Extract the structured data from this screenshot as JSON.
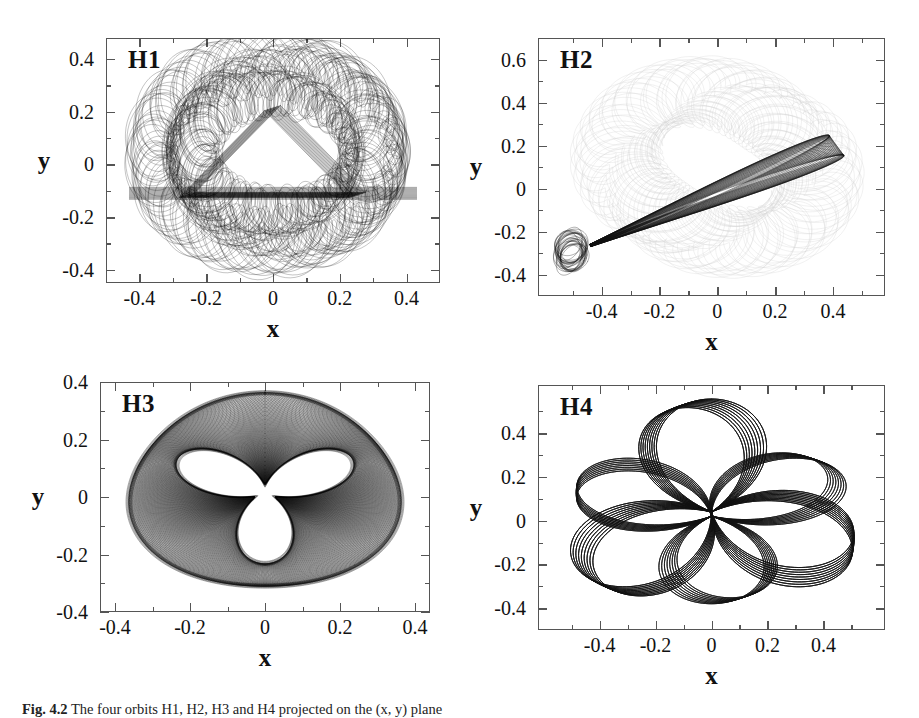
{
  "figure": {
    "caption_label": "Fig. 4.2",
    "caption_text": "The four orbits H1, H2, H3 and H4 projected on the (x, y) plane"
  },
  "panels": [
    {
      "id": "H1",
      "label": "H1",
      "xlabel": "x",
      "ylabel": "y",
      "xticks": [
        "-0.4",
        "-0.2",
        "0",
        "0.2",
        "0.4"
      ],
      "xtick_values": [
        -0.4,
        -0.2,
        0,
        0.2,
        0.4
      ],
      "yticks": [
        "0.4",
        "0.2",
        "0",
        "-0.2",
        "-0.4"
      ],
      "ytick_values": [
        0.4,
        0.2,
        0,
        -0.2,
        -0.4
      ],
      "xlim": [
        -0.5,
        0.5
      ],
      "ylim": [
        -0.45,
        0.48
      ]
    },
    {
      "id": "H2",
      "label": "H2",
      "xlabel": "x",
      "ylabel": "y",
      "xticks": [
        "-0.4",
        "-0.2",
        "0",
        "0.2",
        "0.4"
      ],
      "xtick_values": [
        -0.4,
        -0.2,
        0,
        0.2,
        0.4
      ],
      "yticks": [
        "0.6",
        "0.4",
        "0.2",
        "0",
        "-0.2",
        "-0.4"
      ],
      "ytick_values": [
        0.6,
        0.4,
        0.2,
        0,
        -0.2,
        -0.4
      ],
      "xlim": [
        -0.62,
        0.58
      ],
      "ylim": [
        -0.5,
        0.7
      ]
    },
    {
      "id": "H3",
      "label": "H3",
      "xlabel": "x",
      "ylabel": "y",
      "xticks": [
        "-0.4",
        "-0.2",
        "0",
        "0.2",
        "0.4"
      ],
      "xtick_values": [
        -0.4,
        -0.2,
        0,
        0.2,
        0.4
      ],
      "yticks": [
        "0.4",
        "0.2",
        "0",
        "-0.2",
        "-0.4"
      ],
      "ytick_values": [
        0.4,
        0.2,
        0,
        -0.2,
        -0.4
      ],
      "xlim": [
        -0.44,
        0.44
      ],
      "ylim": [
        -0.4,
        0.4
      ]
    },
    {
      "id": "H4",
      "label": "H4",
      "xlabel": "x",
      "ylabel": "y",
      "xticks": [
        "-0.4",
        "-0.2",
        "0",
        "0.2",
        "0.4"
      ],
      "xtick_values": [
        -0.4,
        -0.2,
        0,
        0.2,
        0.4
      ],
      "yticks": [
        "0.4",
        "0.2",
        "0",
        "-0.2",
        "-0.4"
      ],
      "ytick_values": [
        0.4,
        0.2,
        0,
        -0.2,
        -0.4
      ],
      "xlim": [
        -0.62,
        0.62
      ],
      "ylim": [
        -0.5,
        0.62
      ]
    }
  ],
  "chart_data": {
    "type": "line",
    "title": "",
    "subplots": [
      {
        "name": "H1",
        "xlabel": "x",
        "ylabel": "y",
        "xlim": [
          -0.5,
          0.5
        ],
        "ylim": [
          -0.45,
          0.48
        ],
        "xticks": [
          -0.4,
          -0.2,
          0,
          0.2,
          0.4
        ],
        "yticks": [
          -0.4,
          -0.2,
          0,
          0.2,
          0.4
        ],
        "grid": false,
        "legend": "none",
        "annotation": "H1",
        "orbit_kind": "boxlet-triangular-envelope",
        "envelope_extent": {
          "x_min": -0.44,
          "x_max": 0.44,
          "y_min": -0.35,
          "y_max": 0.47
        },
        "dark_caustic_triangle_vertices": [
          [
            0.0,
            0.21
          ],
          [
            -0.25,
            -0.12
          ],
          [
            0.25,
            -0.12
          ]
        ]
      },
      {
        "name": "H2",
        "xlabel": "x",
        "ylabel": "y",
        "xlim": [
          -0.62,
          0.58
        ],
        "ylim": [
          -0.5,
          0.7
        ],
        "xticks": [
          -0.4,
          -0.2,
          0,
          0.2,
          0.4
        ],
        "yticks": [
          -0.4,
          -0.2,
          0,
          0.2,
          0.4,
          0.6
        ],
        "grid": false,
        "legend": "none",
        "annotation": "H2",
        "orbit_kind": "elongated-banana-band-with-faint-background",
        "band_from": [
          -0.55,
          -0.27
        ],
        "band_to": [
          0.45,
          0.28
        ],
        "faint_background_gray": "#dedede"
      },
      {
        "name": "H3",
        "xlabel": "x",
        "ylabel": "y",
        "xlim": [
          -0.44,
          0.44
        ],
        "ylim": [
          -0.4,
          0.4
        ],
        "xticks": [
          -0.4,
          -0.2,
          0,
          0.2,
          0.4
        ],
        "yticks": [
          -0.4,
          -0.2,
          0,
          0.2,
          0.4
        ],
        "grid": false,
        "legend": "none",
        "annotation": "H3",
        "orbit_kind": "annular-tube-three-fold",
        "outer_radius_x": 0.36,
        "outer_radius_y": 0.345,
        "inner_hole_vertices": [
          [
            0.0,
            -0.26
          ],
          [
            -0.23,
            0.13
          ],
          [
            0.21,
            0.13
          ]
        ]
      },
      {
        "name": "H4",
        "xlabel": "x",
        "ylabel": "y",
        "xlim": [
          -0.62,
          0.62
        ],
        "ylim": [
          -0.5,
          0.62
        ],
        "xticks": [
          -0.4,
          -0.2,
          0,
          0.2,
          0.4
        ],
        "yticks": [
          -0.4,
          -0.2,
          0,
          0.2,
          0.4
        ],
        "grid": false,
        "legend": "none",
        "annotation": "H4",
        "orbit_kind": "three-lobe-rosette",
        "lobe_count": 3,
        "lobe_tip_radius": 0.55,
        "lobe_angles_deg": [
          90,
          210,
          330
        ]
      }
    ]
  }
}
